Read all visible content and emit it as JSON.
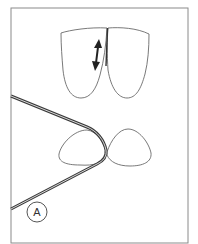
{
  "figure": {
    "panel_label": "A",
    "colors": {
      "background": "#ffffff",
      "frame": "#8a8a8a",
      "outline": "#6a6a6a",
      "wire": "#3a3a3a",
      "arrow": "#222222"
    },
    "elements": [
      {
        "name": "upper-tooth-pair",
        "description": "Two adjacent incisors (labial view) with a double-headed vertical arrow along the contact"
      },
      {
        "name": "lower-tooth-pair",
        "description": "Two adjacent teeth (occlusal view) with a wire looped around the contact"
      },
      {
        "name": "wire-loop",
        "description": "Wire passing around the interproximal contact forming a V-shaped loop"
      },
      {
        "name": "panel-label",
        "description": "Circled letter A"
      }
    ]
  }
}
